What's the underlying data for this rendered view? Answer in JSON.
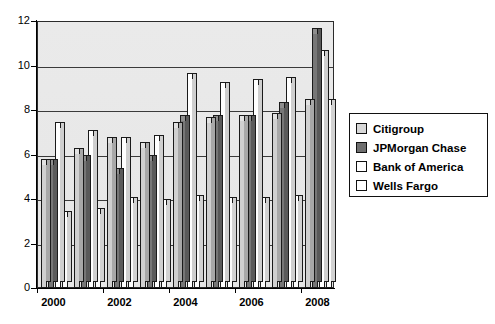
{
  "chart_data": {
    "type": "bar",
    "title": "",
    "xlabel": "",
    "ylabel": "",
    "ylim": [
      0,
      12
    ],
    "yticks": [
      0,
      2,
      4,
      6,
      8,
      10,
      12
    ],
    "grid": true,
    "legend_position": "right",
    "categories": [
      "2000",
      "2001",
      "2002",
      "2003",
      "2004",
      "2005",
      "2006",
      "2007",
      "2008"
    ],
    "tick_labels": [
      "2000",
      "2002",
      "2004",
      "2006",
      "2008"
    ],
    "series": [
      {
        "name": "Citigroup",
        "color": "#d0d0d0",
        "values": [
          5.6,
          6.1,
          6.6,
          6.4,
          7.3,
          7.5,
          7.6,
          7.7,
          8.3
        ]
      },
      {
        "name": "JPMorgan Chase",
        "color": "#777777",
        "values": [
          5.6,
          5.8,
          5.2,
          5.8,
          7.6,
          7.6,
          7.6,
          8.2,
          11.5
        ]
      },
      {
        "name": "Bank of America",
        "color": "#ffffff",
        "values": [
          7.3,
          6.9,
          6.6,
          6.7,
          9.5,
          9.1,
          9.2,
          9.3,
          10.5
        ]
      },
      {
        "name": "Wells Fargo",
        "color": "#ffffff",
        "values": [
          3.3,
          3.4,
          3.9,
          3.8,
          4.0,
          3.9,
          3.9,
          4.0,
          8.3
        ]
      }
    ]
  },
  "legend": {
    "items": [
      {
        "label": "Citigroup"
      },
      {
        "label": "JPMorgan Chase"
      },
      {
        "label": "Bank of America"
      },
      {
        "label": "Wells Fargo"
      }
    ]
  }
}
